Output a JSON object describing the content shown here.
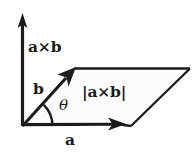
{
  "figure": {
    "canvas": {
      "width": 195,
      "height": 159
    },
    "background_color": "#ffffff",
    "ink_color": "#1c1c1c",
    "parallelogram_fill": "#fcfcfc"
  },
  "labels": {
    "cross_product_axis": "a×b",
    "vector_b": "b",
    "vector_a": "a",
    "area_magnitude": "|a×b|",
    "angle": "θ"
  },
  "geometry": {
    "origin": {
      "x": 22,
      "y": 126
    },
    "axis_tip": {
      "x": 22,
      "y": 14
    },
    "vector_a_tip": {
      "x": 125,
      "y": 124
    },
    "vector_b_tip": {
      "x": 75,
      "y": 68
    },
    "parallelogram_points": "22,126 75,68 190,68 131,126",
    "angle_arc_radius": 30
  }
}
